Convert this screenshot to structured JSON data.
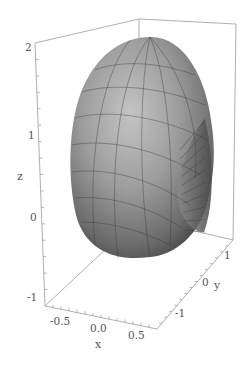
{
  "chart_data": {
    "type": "surface3d",
    "title": "",
    "xlabel": "x",
    "ylabel": "y",
    "zlabel": "z",
    "xlim": [
      -0.75,
      0.65
    ],
    "ylim": [
      -1.8,
      1.4
    ],
    "zlim": [
      -1.2,
      2.05
    ],
    "x_ticks": [
      "-0.5",
      "0.0",
      "0.5"
    ],
    "y_ticks": [
      "-1",
      "0",
      "1"
    ],
    "z_ticks": [
      "-1",
      "0",
      "1",
      "2"
    ],
    "surface_color": "#8c8c8c",
    "mesh_color": "#3a3a3a",
    "box": true,
    "grid": false,
    "legend": "none"
  }
}
